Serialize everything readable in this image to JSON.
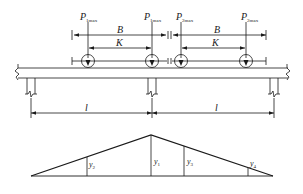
{
  "loads": [
    {
      "symbol": "P",
      "subscript": "1max",
      "x": 88
    },
    {
      "symbol": "P",
      "subscript": "1max",
      "x": 152
    },
    {
      "symbol": "P",
      "subscript": "2max",
      "x": 181
    },
    {
      "symbol": "P",
      "subscript": "2max",
      "x": 246
    }
  ],
  "dimensions": {
    "B_label": "B",
    "K_label": "K",
    "span_label": "l"
  },
  "influence_line": {
    "ordinates": [
      {
        "symbol": "y",
        "subscript": "2"
      },
      {
        "symbol": "y",
        "subscript": "1"
      },
      {
        "symbol": "y",
        "subscript": "3"
      },
      {
        "symbol": "y",
        "subscript": "4"
      }
    ]
  },
  "colors": {
    "line": "#1a1a1a",
    "background": "#ffffff"
  }
}
